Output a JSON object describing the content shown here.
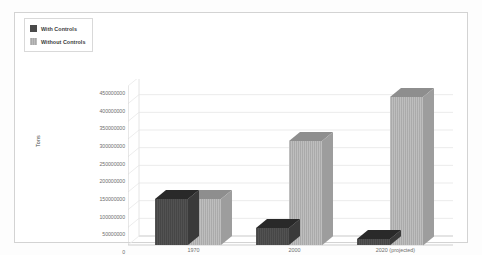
{
  "legend": {
    "items": [
      {
        "label": "With Controls",
        "swatch": "dark-swatch-icon",
        "color": "#4a4a4a"
      },
      {
        "label": "Without Controls",
        "swatch": "light-swatch-icon",
        "color": "#b2b2b2"
      }
    ]
  },
  "chart_data": {
    "type": "bar",
    "title": "",
    "subtitle": "",
    "xlabel": "",
    "ylabel": "Tons",
    "categories": [
      "1970",
      "2000",
      "2020 (projected)"
    ],
    "series": [
      {
        "name": "With Controls",
        "color": "#4a4a4a",
        "values": [
          130000000,
          48000000,
          18000000
        ]
      },
      {
        "name": "Without Controls",
        "color": "#b2b2b2",
        "values": [
          130000000,
          295000000,
          420000000
        ]
      }
    ],
    "ylim": [
      0,
      450000000
    ],
    "ytick_step": 50000000,
    "ytick_labels": [
      "450000000",
      "400000000",
      "350000000",
      "300000000",
      "250000000",
      "200000000",
      "150000000",
      "100000000",
      "50000000",
      "0"
    ],
    "ytick_values": [
      450000000,
      400000000,
      350000000,
      300000000,
      250000000,
      200000000,
      150000000,
      100000000,
      50000000,
      0
    ],
    "grid": true,
    "grid_color": "#ebebeb",
    "legend_position": "top-left",
    "three_d": true,
    "plot_background": "#ffffff"
  }
}
